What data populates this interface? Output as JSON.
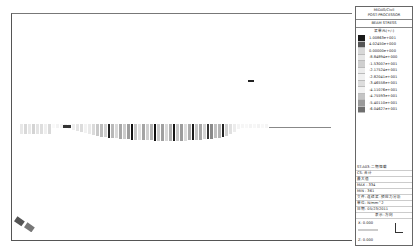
{
  "legend": {
    "title_line1": "MIDAS/Civil",
    "title_line2": "POST-PROCESSOR",
    "result_type": "BEAM STRESS",
    "unit_label": "梁单元(+/-)",
    "scale": [
      {
        "value": "1.00863e+001",
        "color": "#1a1a1a"
      },
      {
        "value": "4.02450e+000",
        "color": "#555555"
      },
      {
        "value": "0.00000e+000",
        "color": "#d8d8d8"
      },
      {
        "value": "-8.84894e+000",
        "color": "#e6e6e6"
      },
      {
        "value": "-1.53007e+001",
        "color": "#cfcfcf"
      },
      {
        "value": "-2.17524e+001",
        "color": "#ececec"
      },
      {
        "value": "-2.82041e+001",
        "color": "#f0f0f0"
      },
      {
        "value": "-3.46558e+001",
        "color": "#dddddd"
      },
      {
        "value": "-4.11076e+001",
        "color": "#f2f2f2"
      },
      {
        "value": "-4.75593e+001",
        "color": "#c4c4c4"
      },
      {
        "value": "-5.40110e+001",
        "color": "#9a9a9a"
      },
      {
        "value": "-6.04627e+001",
        "color": "#6e6e6e"
      }
    ],
    "stage": "ST:A03:二期恒载",
    "cs": "CS: 合计",
    "combo": "最大值",
    "max": "MAX : 334",
    "min": "MIN : 361",
    "file": "文件: 连续梁-预应力分析",
    "unit": "单位: N/mm^2",
    "date": "日期: 05/23/2011",
    "view_dir": "表示-方向",
    "x": "X: 0.000",
    "y": "Y: -1.000",
    "z": "Z: 0.000"
  },
  "beam_bars": [
    {
      "w": 3,
      "c": "#e8e8e8",
      "h": 10
    },
    {
      "w": 3,
      "c": "#d9d9d9",
      "h": 10
    },
    {
      "w": 3,
      "c": "#e8e8e8",
      "h": 10
    },
    {
      "w": 3,
      "c": "#d4d4d4",
      "h": 10
    },
    {
      "w": 3,
      "c": "#e4e4e4",
      "h": 10
    },
    {
      "w": 3,
      "c": "#dedede",
      "h": 10
    },
    {
      "w": 3,
      "c": "#efefef",
      "h": 10
    },
    {
      "w": 3,
      "c": "#d9d9d9",
      "h": 10
    },
    {
      "w": 3,
      "c": "#fafafa",
      "h": 4
    },
    {
      "w": 3,
      "c": "#f3f3f3",
      "h": 4
    },
    {
      "w": 3,
      "c": "#f5f5f5",
      "h": 4
    },
    {
      "w": 3,
      "c": "#f0f0f0",
      "h": 4
    },
    {
      "w": 3,
      "c": "#f6f6f6",
      "h": 5
    },
    {
      "w": 3,
      "c": "#eeeeee",
      "h": 6
    },
    {
      "w": 3,
      "c": "#e4e4e4",
      "h": 7
    },
    {
      "w": 3,
      "c": "#dcdcdc",
      "h": 8
    },
    {
      "w": 3,
      "c": "#f2f2f2",
      "h": 9
    },
    {
      "w": 3,
      "c": "#e9e9e9",
      "h": 10
    },
    {
      "w": 3,
      "c": "#dadada",
      "h": 11
    },
    {
      "w": 3,
      "c": "#c8c8c8",
      "h": 12
    },
    {
      "w": 3,
      "c": "#bdbdbd",
      "h": 13
    },
    {
      "w": 3,
      "c": "#d2d2d2",
      "h": 13
    },
    {
      "w": 2,
      "c": "#222222",
      "h": 14
    },
    {
      "w": 3,
      "c": "#b8b8b8",
      "h": 14
    },
    {
      "w": 3,
      "c": "#d8d8d8",
      "h": 14
    },
    {
      "w": 3,
      "c": "#a8a8a8",
      "h": 15
    },
    {
      "w": 3,
      "c": "#cccccc",
      "h": 15
    },
    {
      "w": 3,
      "c": "#9d9d9d",
      "h": 15
    },
    {
      "w": 2,
      "c": "#111111",
      "h": 16
    },
    {
      "w": 3,
      "c": "#c4c4c4",
      "h": 16
    },
    {
      "w": 3,
      "c": "#e0e0e0",
      "h": 16
    },
    {
      "w": 3,
      "c": "#a4a4a4",
      "h": 16
    },
    {
      "w": 3,
      "c": "#d0d0d0",
      "h": 16
    },
    {
      "w": 3,
      "c": "#b4b4b4",
      "h": 16
    },
    {
      "w": 2,
      "c": "#111111",
      "h": 17
    },
    {
      "w": 3,
      "c": "#cacaca",
      "h": 17
    },
    {
      "w": 3,
      "c": "#a0a0a0",
      "h": 17
    },
    {
      "w": 3,
      "c": "#d8d8d8",
      "h": 17
    },
    {
      "w": 3,
      "c": "#b0b0b0",
      "h": 17
    },
    {
      "w": 2,
      "c": "#181818",
      "h": 17
    },
    {
      "w": 3,
      "c": "#c8c8c8",
      "h": 17
    },
    {
      "w": 3,
      "c": "#9c9c9c",
      "h": 17
    },
    {
      "w": 3,
      "c": "#dcdcdc",
      "h": 17
    },
    {
      "w": 3,
      "c": "#acacac",
      "h": 16
    },
    {
      "w": 2,
      "c": "#1a1a1a",
      "h": 16
    },
    {
      "w": 3,
      "c": "#c4c4c4",
      "h": 16
    },
    {
      "w": 3,
      "c": "#a8a8a8",
      "h": 16
    },
    {
      "w": 3,
      "c": "#d4d4d4",
      "h": 15
    },
    {
      "w": 2,
      "c": "#333333",
      "h": 15
    },
    {
      "w": 3,
      "c": "#8a8a8a",
      "h": 15
    },
    {
      "w": 3,
      "c": "#c0c0c0",
      "h": 14
    },
    {
      "w": 3,
      "c": "#b4b4b4",
      "h": 14
    },
    {
      "w": 2,
      "c": "#222222",
      "h": 13
    },
    {
      "w": 3,
      "c": "#d0d0d0",
      "h": 12
    },
    {
      "w": 3,
      "c": "#e0e0e0",
      "h": 10
    },
    {
      "w": 3,
      "c": "#ececec",
      "h": 8
    },
    {
      "w": 3,
      "c": "#f4f4f4",
      "h": 5
    },
    {
      "w": 3,
      "c": "#f6f6f6",
      "h": 4
    },
    {
      "w": 3,
      "c": "#f8f8f8",
      "h": 4
    },
    {
      "w": 3,
      "c": "#f4f4f4",
      "h": 4
    },
    {
      "w": 3,
      "c": "#f7f7f7",
      "h": 4
    },
    {
      "w": 3,
      "c": "#f3f3f3",
      "h": 4
    },
    {
      "w": 3,
      "c": "#f8f8f8",
      "h": 4
    },
    {
      "w": 3,
      "c": "#f5f5f5",
      "h": 4
    }
  ]
}
